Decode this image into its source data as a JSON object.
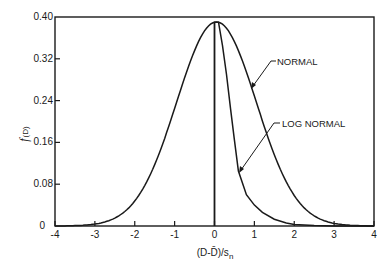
{
  "chart_data": {
    "type": "line",
    "title": "",
    "xlabel": "(D-D̄)/s_n",
    "xlabel_main": "(D-D̄)/s",
    "xlabel_sub": "n",
    "ylabel": "f(D)",
    "ylabel_f": "f",
    "ylabel_rest": "(D)",
    "xlim": [
      -4,
      4
    ],
    "ylim": [
      0,
      0.4
    ],
    "grid": false,
    "legend": "inline annotations with leader arrows",
    "x_ticks": [
      -4,
      -3,
      -2,
      -1,
      0,
      1,
      2,
      3,
      4
    ],
    "x_tick_labels": [
      "-4",
      "-3",
      "-2",
      "-1",
      "0",
      "1",
      "2",
      "3",
      "4"
    ],
    "y_ticks": [
      0,
      0.08,
      0.16,
      0.24,
      0.32,
      0.4
    ],
    "y_tick_labels": [
      "0",
      "0.08",
      "0.16",
      "0.24",
      "0.32",
      "0.40"
    ],
    "series": [
      {
        "name": "NORMAL",
        "x": [
          -4,
          -3.5,
          -3,
          -2.5,
          -2,
          -1.5,
          -1,
          -0.5,
          0,
          0.1,
          0.5,
          1,
          1.5,
          2,
          2.5,
          3,
          3.5,
          4
        ],
        "values": [
          0.0,
          0.001,
          0.005,
          0.017,
          0.05,
          0.125,
          0.235,
          0.345,
          0.389,
          0.39,
          0.36,
          0.266,
          0.155,
          0.065,
          0.022,
          0.006,
          0.001,
          0.0
        ]
      },
      {
        "name": "LOG NORMAL",
        "x": [
          0,
          0,
          0.1,
          0.2,
          0.3,
          0.4,
          0.5,
          0.6,
          0.8,
          1.0,
          1.2,
          1.5,
          1.8,
          2.0,
          2.5,
          3,
          4
        ],
        "values": [
          0,
          0.39,
          0.39,
          0.345,
          0.29,
          0.225,
          0.165,
          0.105,
          0.06,
          0.04,
          0.026,
          0.013,
          0.006,
          0.003,
          0.001,
          0.0,
          0.0
        ]
      }
    ],
    "annotations": [
      {
        "text": "NORMAL",
        "points_to_series": "NORMAL",
        "arrow_at_x": 0.93
      },
      {
        "text": "LOG NORMAL",
        "points_to_series": "LOG NORMAL",
        "arrow_at_x": 0.58
      }
    ],
    "reference_lines": [
      {
        "orientation": "vertical",
        "x": 0,
        "from_y": 0,
        "to_y": 0.39
      }
    ]
  }
}
